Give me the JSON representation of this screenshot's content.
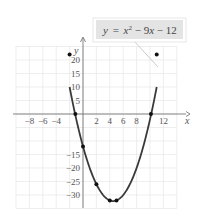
{
  "chart_data": {
    "type": "line",
    "title": "",
    "equation_label": {
      "y": "y",
      "eq": "=",
      "x": "x",
      "sup": "2",
      "rest1": " − 9",
      "x2": "x",
      "rest2": " − 12"
    },
    "xlabel": "x",
    "ylabel": "y",
    "xlim": [
      -10,
      14
    ],
    "ylim": [
      -35,
      25
    ],
    "grid": true,
    "x_ticks": [
      {
        "value": -8,
        "label": "−8"
      },
      {
        "value": -6,
        "label": "−6"
      },
      {
        "value": -4,
        "label": "−4"
      },
      {
        "value": 2,
        "label": "2"
      },
      {
        "value": 4,
        "label": "4"
      },
      {
        "value": 6,
        "label": "6"
      },
      {
        "value": 8,
        "label": "8"
      },
      {
        "value": 12,
        "label": "12"
      }
    ],
    "y_ticks": [
      {
        "value": 20,
        "label": "20"
      },
      {
        "value": 15,
        "label": "15"
      },
      {
        "value": 10,
        "label": "10"
      },
      {
        "value": 5,
        "label": "5"
      },
      {
        "value": -15,
        "label": "−15"
      },
      {
        "value": -20,
        "label": "−20"
      },
      {
        "value": -25,
        "label": "−25"
      },
      {
        "value": -30,
        "label": "−30"
      }
    ],
    "series": [
      {
        "name": "y = x^2 - 9x - 12",
        "function": "x^2 - 9x - 12",
        "domain": [
          -2,
          11
        ],
        "points": [
          {
            "x": -2,
            "y": 10
          },
          {
            "x": -1.14,
            "y": 0
          },
          {
            "x": 0,
            "y": -12
          },
          {
            "x": 2,
            "y": -26
          },
          {
            "x": 4,
            "y": -32
          },
          {
            "x": 5,
            "y": -32
          },
          {
            "x": 10.14,
            "y": 0
          },
          {
            "x": 11,
            "y": 10
          }
        ]
      }
    ],
    "colors": {
      "curve": "#3a3a3a",
      "grid": "#e6e6e6",
      "axis": "#777777",
      "label_box": "#e4e4e4"
    }
  }
}
